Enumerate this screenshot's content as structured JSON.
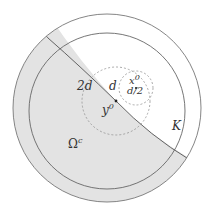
{
  "diagram": {
    "title": "",
    "colors": {
      "shading": "#e3e3e3",
      "stroke": "#666666",
      "dashed": "#888888",
      "text": "#333333"
    },
    "labels": {
      "two_d": "2d",
      "d": "d",
      "x0": "x",
      "x0_sup": "0",
      "d_half": "d/2",
      "y0": "y",
      "y0_sup": "0",
      "K": "K",
      "omega_c": "Ω",
      "omega_c_sup": "c"
    },
    "elements": [
      "outer-circle",
      "inner-circle-K",
      "boundary-curve",
      "shaded-region-omega-complement",
      "dashed-circle-radius-2d-centered-y0",
      "dashed-circle-radius-d-half-centered-x0",
      "point-y0",
      "point-x0"
    ]
  }
}
